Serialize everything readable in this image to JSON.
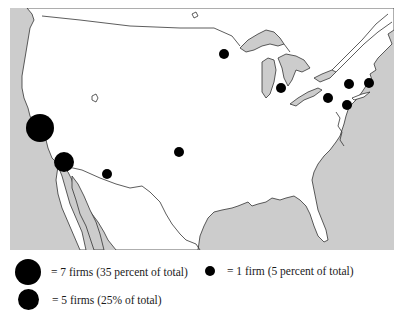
{
  "map": {
    "region": "Continental United States",
    "colors": {
      "land": "#ffffff",
      "water": "#cccccc",
      "border": "#333333",
      "marker": "#000000"
    },
    "markers": [
      {
        "id": "sf-bay-area",
        "x": 40,
        "y": 128,
        "r": 14,
        "firms": 7
      },
      {
        "id": "los-angeles",
        "x": 64,
        "y": 162,
        "r": 10,
        "firms": 5
      },
      {
        "id": "phoenix",
        "x": 107,
        "y": 174,
        "r": 5,
        "firms": 1
      },
      {
        "id": "central",
        "x": 179,
        "y": 152,
        "r": 5,
        "firms": 1
      },
      {
        "id": "minneapolis",
        "x": 224,
        "y": 54,
        "r": 5,
        "firms": 1
      },
      {
        "id": "chicago",
        "x": 281,
        "y": 88,
        "r": 5,
        "firms": 1
      },
      {
        "id": "pittsburgh",
        "x": 328,
        "y": 98,
        "r": 5,
        "firms": 1
      },
      {
        "id": "new-york-upstate",
        "x": 349,
        "y": 84,
        "r": 5,
        "firms": 1
      },
      {
        "id": "boston",
        "x": 369,
        "y": 83,
        "r": 5,
        "firms": 1
      },
      {
        "id": "new-jersey",
        "x": 347,
        "y": 105,
        "r": 5,
        "firms": 1
      }
    ]
  },
  "legend": {
    "items": [
      {
        "label": "= 7 firms (35 percent of total)",
        "firms": 7,
        "size": 26
      },
      {
        "label": "= 1 firm (5 percent of total)",
        "firms": 1,
        "size": 10
      },
      {
        "label": "= 5 firms (25% of total)",
        "firms": 5,
        "size": 21
      }
    ]
  }
}
